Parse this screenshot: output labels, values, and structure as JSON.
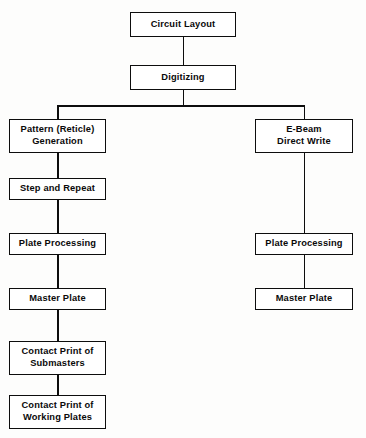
{
  "diagram": {
    "type": "flowchart",
    "orientation": "top-down",
    "style": {
      "box_fill": "#ffffff",
      "box_border": "#0d0d0d",
      "line_color": "#0d0d0d",
      "text_color": "#0a0a0a",
      "background": "#fdfdfc"
    },
    "nodes": {
      "circuit_layout": "Circuit Layout",
      "digitizing": "Digitizing",
      "pattern_reticle_generation": "Pattern (Reticle)\nGeneration",
      "step_and_repeat": "Step and Repeat",
      "plate_processing_left": "Plate Processing",
      "master_plate_left": "Master Plate",
      "contact_print_submasters": "Contact Print of\nSubmasters",
      "contact_print_working_plates": "Contact Print of\nWorking Plates",
      "ebeam_direct_write": "E-Beam\nDirect Write",
      "plate_processing_right": "Plate Processing",
      "master_plate_right": "Master Plate"
    },
    "branches": {
      "left_label": "Pattern (Reticle) Generation path",
      "right_label": "E-Beam Direct Write path"
    },
    "edges": [
      "Circuit Layout -> Digitizing",
      "Digitizing -> Pattern (Reticle) Generation",
      "Digitizing -> E-Beam Direct Write",
      "Pattern (Reticle) Generation -> Step and Repeat",
      "Step and Repeat -> Plate Processing",
      "Plate Processing -> Master Plate",
      "Master Plate -> Contact Print of Submasters",
      "Contact Print of Submasters -> Contact Print of Working Plates",
      "E-Beam Direct Write -> Plate Processing",
      "Plate Processing -> Master Plate"
    ],
    "caption": ""
  }
}
